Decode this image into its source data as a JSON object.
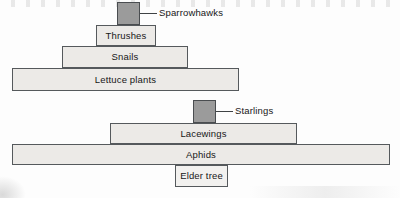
{
  "figure": {
    "kind": "ecological-pyramid-diagram",
    "colors": {
      "bar_fill_light": "#eceae7",
      "bar_fill_dark": "#9b9b9b",
      "bar_stroke": "#55595c",
      "text": "#171717",
      "background": "#fdfdfd"
    }
  },
  "pyramids": [
    {
      "id": "lettuce-pyramid",
      "levels": [
        {
          "label": "Sparrowhawks",
          "label_placement": "external-right",
          "fill": "dark",
          "x": 117,
          "y": 2,
          "width": 23,
          "height": 23
        },
        {
          "label": "Thrushes",
          "label_placement": "inside",
          "fill": "light",
          "x": 96,
          "y": 25,
          "width": 60,
          "height": 21
        },
        {
          "label": "Snails",
          "label_placement": "inside",
          "fill": "light",
          "x": 62,
          "y": 46,
          "width": 126,
          "height": 22
        },
        {
          "label": "Lettuce plants",
          "label_placement": "inside",
          "fill": "light",
          "x": 12,
          "y": 68,
          "width": 227,
          "height": 23
        }
      ],
      "callouts": [
        {
          "for": "Sparrowhawks",
          "line_x": 140,
          "line_y": 13,
          "line_width": 17,
          "text_x": 159,
          "text_y": 8
        }
      ]
    },
    {
      "id": "elder-pyramid",
      "levels": [
        {
          "label": "Starlings",
          "label_placement": "external-right",
          "fill": "dark",
          "x": 193,
          "y": 100,
          "width": 23,
          "height": 23
        },
        {
          "label": "Lacewings",
          "label_placement": "inside",
          "fill": "light",
          "x": 110,
          "y": 123,
          "width": 187,
          "height": 21
        },
        {
          "label": "Aphids",
          "label_placement": "inside",
          "fill": "light",
          "x": 12,
          "y": 144,
          "width": 378,
          "height": 21
        },
        {
          "label": "Elder tree",
          "label_placement": "inside",
          "fill": "plain",
          "x": 175,
          "y": 165,
          "width": 53,
          "height": 22
        }
      ],
      "callouts": [
        {
          "for": "Starlings",
          "line_x": 216,
          "line_y": 111,
          "line_width": 17,
          "text_x": 235,
          "text_y": 106
        }
      ]
    }
  ]
}
